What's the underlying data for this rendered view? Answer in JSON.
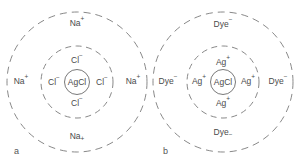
{
  "figure": {
    "panels": [
      {
        "id": "a",
        "letter": "a",
        "core": "AgCl",
        "inner_ions": {
          "top": "Cl",
          "left": "Cl",
          "right": "Cl",
          "bottom": "Cl",
          "charge": "−"
        },
        "outer_ions": {
          "top": "Na",
          "left": "Na",
          "right": "Na",
          "bottom": "Na",
          "charge": "+"
        }
      },
      {
        "id": "b",
        "letter": "b",
        "core": "AgCl",
        "inner_ions": {
          "top": "Ag",
          "left": "Ag",
          "right": "Ag",
          "bottom": "Ag",
          "charge": "+"
        },
        "outer_ions": {
          "top": "Dye",
          "left": "Dye",
          "right": "Dye",
          "bottom": "Dye",
          "charge": "−"
        }
      }
    ],
    "colors": {
      "stroke": "#7a7a7a",
      "text": "#4a4a4a"
    }
  }
}
